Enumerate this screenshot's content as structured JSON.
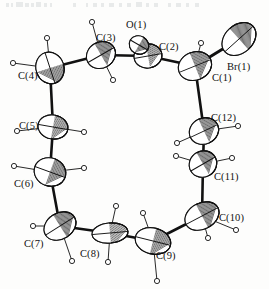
{
  "figure": {
    "type": "crystal-structure-ortep-diagram",
    "background_color": "#fdfdfc",
    "line_color": "#111111",
    "ellipsoid_fill": "#ffffff",
    "hydrogen_fill": "#ffffff"
  },
  "atoms": [
    {
      "id": "C1",
      "label": "C(1)",
      "element": "C",
      "cx": 195,
      "cy": 66,
      "rx": 17,
      "ry": 14,
      "rot": -22,
      "label_x": 212,
      "label_y": 81,
      "shaded": true
    },
    {
      "id": "C2",
      "label": "C(2)",
      "element": "C",
      "cx": 148,
      "cy": 56,
      "rx": 14,
      "ry": 12,
      "rot": -10,
      "label_x": 159,
      "label_y": 50,
      "shaded": true
    },
    {
      "id": "O1",
      "label": "O(1)",
      "element": "O",
      "cx": 139,
      "cy": 45,
      "rx": 10,
      "ry": 9,
      "rot": 30,
      "label_x": 126,
      "label_y": 28,
      "shaded": true
    },
    {
      "id": "C3",
      "label": "C(3)",
      "element": "C",
      "cx": 101,
      "cy": 55,
      "rx": 15,
      "ry": 13,
      "rot": -30,
      "label_x": 96,
      "label_y": 41,
      "shaded": true
    },
    {
      "id": "C4",
      "label": "C(4)",
      "element": "C",
      "cx": 50,
      "cy": 68,
      "rx": 16,
      "ry": 14,
      "rot": 72,
      "label_x": 18,
      "label_y": 79,
      "shaded": true
    },
    {
      "id": "C5",
      "label": "C(5)",
      "element": "C",
      "cx": 53,
      "cy": 127,
      "rx": 15,
      "ry": 12,
      "rot": 10,
      "label_x": 19,
      "label_y": 129,
      "shaded": true
    },
    {
      "id": "C6",
      "label": "C(6)",
      "element": "C",
      "cx": 50,
      "cy": 172,
      "rx": 16,
      "ry": 14,
      "rot": 20,
      "label_x": 14,
      "label_y": 187,
      "shaded": true
    },
    {
      "id": "C7",
      "label": "C(7)",
      "element": "C",
      "cx": 60,
      "cy": 226,
      "rx": 17,
      "ry": 13,
      "rot": -32,
      "label_x": 24,
      "label_y": 247,
      "shaded": true
    },
    {
      "id": "C8",
      "label": "C(8)",
      "element": "C",
      "cx": 110,
      "cy": 233,
      "rx": 18,
      "ry": 10,
      "rot": -5,
      "label_x": 80,
      "label_y": 257,
      "shaded": true
    },
    {
      "id": "C9",
      "label": "C(9)",
      "element": "C",
      "cx": 153,
      "cy": 241,
      "rx": 18,
      "ry": 13,
      "rot": 14,
      "label_x": 156,
      "label_y": 259,
      "shaded": true
    },
    {
      "id": "C10",
      "label": "C(10)",
      "element": "C",
      "cx": 202,
      "cy": 216,
      "rx": 18,
      "ry": 13,
      "rot": -28,
      "label_x": 219,
      "label_y": 221,
      "shaded": true
    },
    {
      "id": "C11",
      "label": "C(11)",
      "element": "C",
      "cx": 203,
      "cy": 164,
      "rx": 14,
      "ry": 13,
      "rot": -30,
      "label_x": 214,
      "label_y": 180,
      "shaded": true
    },
    {
      "id": "C12",
      "label": "C(12)",
      "element": "C",
      "cx": 204,
      "cy": 131,
      "rx": 15,
      "ry": 13,
      "rot": -25,
      "label_x": 211,
      "label_y": 121,
      "shaded": true
    },
    {
      "id": "Br1",
      "label": "Br(1)",
      "element": "Br",
      "cx": 239,
      "cy": 39,
      "rx": 19,
      "ry": 14,
      "rot": -42,
      "label_x": 227,
      "label_y": 70,
      "shaded": true
    }
  ],
  "bonds": [
    {
      "from": "C1",
      "to": "C2",
      "width": 2.6
    },
    {
      "from": "C2",
      "to": "C3",
      "width": 2.6
    },
    {
      "from": "C2",
      "to": "O1",
      "width": 2.2
    },
    {
      "from": "C3",
      "to": "C4",
      "width": 2.6
    },
    {
      "from": "C4",
      "to": "C5",
      "width": 2.6
    },
    {
      "from": "C5",
      "to": "C6",
      "width": 2.6
    },
    {
      "from": "C6",
      "to": "C7",
      "width": 2.6
    },
    {
      "from": "C7",
      "to": "C8",
      "width": 2.6
    },
    {
      "from": "C8",
      "to": "C9",
      "width": 2.6
    },
    {
      "from": "C9",
      "to": "C10",
      "width": 2.6
    },
    {
      "from": "C10",
      "to": "C11",
      "width": 2.6
    },
    {
      "from": "C11",
      "to": "C12",
      "width": 2.6
    },
    {
      "from": "C12",
      "to": "C1",
      "width": 2.6
    },
    {
      "from": "C1",
      "to": "Br1",
      "width": 3.0
    }
  ],
  "hydrogens": [
    {
      "id": "H1",
      "parent": "C1",
      "x": 201,
      "y": 43,
      "r": 2.6
    },
    {
      "id": "H3a",
      "parent": "C3",
      "x": 92,
      "y": 22,
      "r": 2.6
    },
    {
      "id": "H3b",
      "parent": "C3",
      "x": 113,
      "y": 80,
      "r": 2.6
    },
    {
      "id": "H4a",
      "parent": "C4",
      "x": 47,
      "y": 38,
      "r": 2.6
    },
    {
      "id": "H4b",
      "parent": "C4",
      "x": 13,
      "y": 63,
      "r": 2.6
    },
    {
      "id": "H5a",
      "parent": "C5",
      "x": 17,
      "y": 131,
      "r": 2.6
    },
    {
      "id": "H5b",
      "parent": "C5",
      "x": 84,
      "y": 132,
      "r": 2.6
    },
    {
      "id": "H6a",
      "parent": "C6",
      "x": 14,
      "y": 166,
      "r": 2.6
    },
    {
      "id": "H6b",
      "parent": "C6",
      "x": 84,
      "y": 168,
      "r": 2.6
    },
    {
      "id": "H7a",
      "parent": "C7",
      "x": 33,
      "y": 226,
      "r": 2.6
    },
    {
      "id": "H7b",
      "parent": "C7",
      "x": 72,
      "y": 261,
      "r": 2.6
    },
    {
      "id": "H8a",
      "parent": "C8",
      "x": 116,
      "y": 206,
      "r": 2.6
    },
    {
      "id": "H8b",
      "parent": "C8",
      "x": 108,
      "y": 262,
      "r": 2.6
    },
    {
      "id": "H9a",
      "parent": "C9",
      "x": 143,
      "y": 213,
      "r": 2.6
    },
    {
      "id": "H9b",
      "parent": "C9",
      "x": 157,
      "y": 281,
      "r": 2.6
    },
    {
      "id": "H10a",
      "parent": "C10",
      "x": 208,
      "y": 238,
      "r": 2.6
    },
    {
      "id": "H10b",
      "parent": "C10",
      "x": 236,
      "y": 230,
      "r": 2.6
    },
    {
      "id": "H11a",
      "parent": "C11",
      "x": 176,
      "y": 156,
      "r": 2.6
    },
    {
      "id": "H11b",
      "parent": "C11",
      "x": 232,
      "y": 158,
      "r": 2.6
    },
    {
      "id": "H12a",
      "parent": "C12",
      "x": 177,
      "y": 143,
      "r": 2.6
    },
    {
      "id": "H12b",
      "parent": "C12",
      "x": 238,
      "y": 126,
      "r": 2.6
    }
  ]
}
